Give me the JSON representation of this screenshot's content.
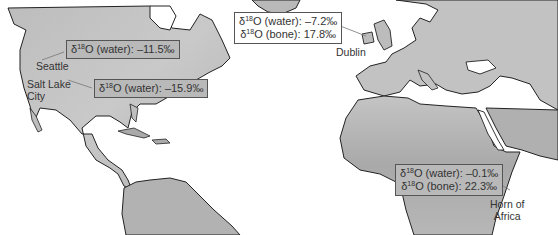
{
  "map": {
    "style": "grayscale isotope gradient map",
    "colors": {
      "ocean": "#ffffff",
      "land_light": "#c8c8c8",
      "land_mid": "#b4b4b4",
      "land_dark": "#9a9a9a",
      "coastline": "#222222",
      "callout_border": "#555555",
      "text": "#333333"
    }
  },
  "locations": [
    {
      "id": "seattle",
      "city": "Seattle",
      "prefix": "δ",
      "sup": "18",
      "lines": [
        {
          "label": "O (water): ",
          "value": "–11.5‰"
        }
      ]
    },
    {
      "id": "salt-lake-city",
      "city": "Salt Lake City",
      "city_lines": [
        "Salt Lake",
        "City"
      ],
      "prefix": "δ",
      "sup": "18",
      "lines": [
        {
          "label": "O (water): ",
          "value": "–15.9‰"
        }
      ]
    },
    {
      "id": "dublin",
      "city": "Dublin",
      "prefix": "δ",
      "sup": "18",
      "lines": [
        {
          "label": "O (water): ",
          "value": "–7.2‰"
        },
        {
          "label": "O (bone): ",
          "value": "17.8‰"
        }
      ]
    },
    {
      "id": "horn-of-africa",
      "city": "Horn of Africa",
      "city_lines": [
        "Horn of",
        "Africa"
      ],
      "prefix": "δ",
      "sup": "18",
      "lines": [
        {
          "label": "O (water): ",
          "value": "–0.1‰"
        },
        {
          "label": "O (bone): ",
          "value": "22.3‰"
        }
      ]
    }
  ]
}
